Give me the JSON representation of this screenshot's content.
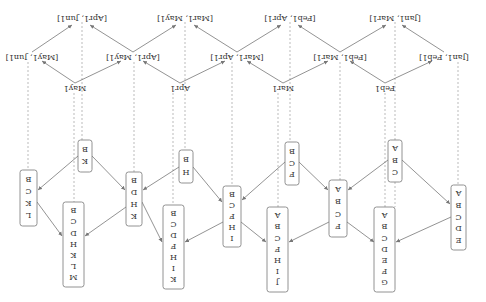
{
  "diagram": {
    "orientation": "rotated 180 degrees",
    "top_intervals": [
      "[Jan1, Mar1]",
      "[Feb1, Apr1]",
      "[Mar1, May1]",
      "[Apr1, Jun1]"
    ],
    "mid_intervals": [
      "[Jan1, Feb1]",
      "[Feb1, Mar1]",
      "[Mar1, Apr1]",
      "[Apr1, May1]",
      "[May1, Jun1]"
    ],
    "points": [
      "Feb1",
      "Mar1",
      "Apr1",
      "May1"
    ],
    "sets": {
      "ABC": [
        "A",
        "B",
        "C"
      ],
      "ABCDE": [
        "A",
        "B",
        "C",
        "D",
        "E"
      ],
      "ABCF": [
        "A",
        "B",
        "C",
        "F"
      ],
      "ABCDEFG": [
        "A",
        "B",
        "C",
        "D",
        "E",
        "F",
        "G"
      ],
      "BCF": [
        "B",
        "C",
        "F"
      ],
      "ABCFHIJ": [
        "A",
        "B",
        "C",
        "F",
        "H",
        "I",
        "J"
      ],
      "BCFHI": [
        "B",
        "C",
        "F",
        "H",
        "I"
      ],
      "BH": [
        "B",
        "H"
      ],
      "BCDFHIK": [
        "B",
        "C",
        "D",
        "F",
        "H",
        "I",
        "K"
      ],
      "BDHK": [
        "B",
        "D",
        "H",
        "K"
      ],
      "BK": [
        "B",
        "K"
      ],
      "BCDHKLM": [
        "B",
        "C",
        "D",
        "H",
        "K",
        "L",
        "M"
      ],
      "BCKL": [
        "B",
        "C",
        "K",
        "L"
      ]
    }
  }
}
